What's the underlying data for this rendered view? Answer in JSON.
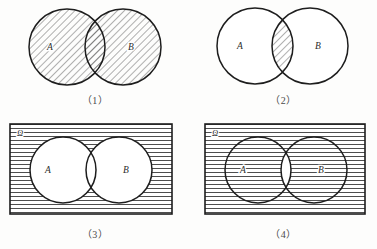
{
  "page": {
    "background_color": "#fdfdfc",
    "stroke_color": "#1d1d1d",
    "hatch_color": "#3a3a3a",
    "fill_white": "#ffffff"
  },
  "figures": [
    {
      "id": "figure-1",
      "caption": "（1）",
      "caption_plain": "(1)",
      "universe_label": null,
      "has_universe_rect": false,
      "set_a_label": "A",
      "set_b_label": "B",
      "shaded_region": "A-union-B",
      "shaded_description": "Both circles entirely shaded with diagonal hatching",
      "hatch_style": "diagonal",
      "hatch_spacing_px": 5,
      "circle_a": {
        "cx": 67,
        "cy": 47,
        "r": 38
      },
      "circle_b": {
        "cx": 123,
        "cy": 47,
        "r": 38
      },
      "label_a_pos": {
        "x": 50,
        "y": 50
      },
      "label_b_pos": {
        "x": 131,
        "y": 50
      }
    },
    {
      "id": "figure-2",
      "caption": "（2）",
      "caption_plain": "(2)",
      "universe_label": null,
      "has_universe_rect": false,
      "set_a_label": "A",
      "set_b_label": "B",
      "shaded_region": "A-intersect-B",
      "shaded_description": "Only the lens-shaped intersection shaded with diagonal hatching",
      "hatch_style": "diagonal",
      "hatch_spacing_px": 5,
      "circle_a": {
        "cx": 65,
        "cy": 46,
        "r": 38
      },
      "circle_b": {
        "cx": 120,
        "cy": 46,
        "r": 38
      },
      "label_a_pos": {
        "x": 50,
        "y": 49
      },
      "label_b_pos": {
        "x": 128,
        "y": 49
      }
    },
    {
      "id": "figure-3",
      "caption": "（3）",
      "caption_plain": "(3)",
      "universe_label": "Ω",
      "has_universe_rect": true,
      "set_a_label": "A",
      "set_b_label": "B",
      "shaded_region": "complement-of-A-union-B",
      "shaded_description": "Rectangle shaded with horizontal lines; both circles left white",
      "hatch_style": "horizontal",
      "hatch_spacing_px": 4,
      "rect": {
        "x": 10,
        "y": 12,
        "w": 162,
        "h": 90
      },
      "circle_a": {
        "cx": 63,
        "cy": 58,
        "r": 33
      },
      "circle_b": {
        "cx": 119,
        "cy": 58,
        "r": 33
      },
      "label_a_pos": {
        "x": 48,
        "y": 61
      },
      "label_b_pos": {
        "x": 126,
        "y": 61
      },
      "omega_pos": {
        "x": 17,
        "y": 24
      }
    },
    {
      "id": "figure-4",
      "caption": "（4）",
      "caption_plain": "(4)",
      "universe_label": "Ω",
      "has_universe_rect": true,
      "set_a_label": "A",
      "set_b_label": "B",
      "shaded_region": "complement-of-A-intersect-B",
      "shaded_description": "Entire rectangle shaded with horizontal lines except the lens-shaped intersection which is white",
      "hatch_style": "horizontal",
      "hatch_spacing_px": 4,
      "rect": {
        "x": 15,
        "y": 12,
        "w": 160,
        "h": 90
      },
      "circle_a": {
        "cx": 68,
        "cy": 58,
        "r": 33
      },
      "circle_b": {
        "cx": 124,
        "cy": 58,
        "r": 33
      },
      "label_a_pos": {
        "x": 53,
        "y": 61
      },
      "label_b_pos": {
        "x": 131,
        "y": 61
      },
      "omega_pos": {
        "x": 22,
        "y": 24
      }
    }
  ]
}
